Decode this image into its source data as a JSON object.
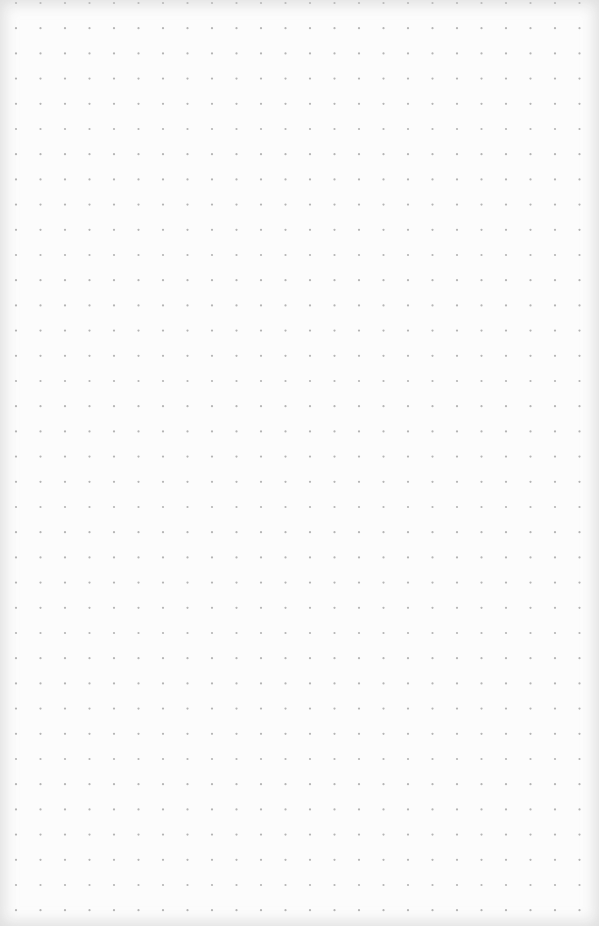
{
  "paper": {
    "type": "dot-grid",
    "background_color": "#fcfcfc",
    "dot_color": "#b4b4b4",
    "dot_radius": 1.1,
    "spacing_x": 24.5,
    "spacing_y": 25.2,
    "origin_x": 16,
    "origin_y": 3,
    "width": 599,
    "height": 926
  }
}
